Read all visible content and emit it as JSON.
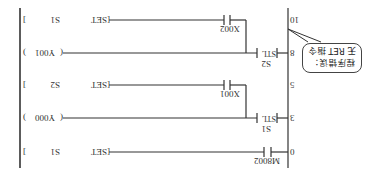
{
  "diagram": {
    "orientation": "rotated-180",
    "rungs": [
      {
        "step": "0",
        "contact": "M8002",
        "output_type": "SET",
        "output_operand": "S1"
      },
      {
        "step": "3",
        "stl": "S1",
        "output_type": "OUT",
        "output_operand": "Y000"
      },
      {
        "step": "5",
        "contact": "X001",
        "output_type": "SET",
        "output_operand": "S2"
      },
      {
        "step": "8",
        "stl": "S2",
        "output_type": "OUT",
        "output_operand": "Y001"
      },
      {
        "step": "10",
        "contact": "X002",
        "output_type": "SET",
        "output_operand": "S1"
      }
    ],
    "stl_label": "STL",
    "set_label": "SET",
    "callout": {
      "line1": "程序错误：",
      "line2": "无 RET 指令"
    },
    "colors": {
      "line": "#333333",
      "background": "#ffffff"
    }
  }
}
